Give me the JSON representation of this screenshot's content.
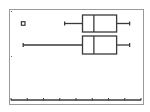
{
  "colors": {
    "background": "#ffffff",
    "frame": "#9a9a9a",
    "ink": "#3a3a3a"
  },
  "chart_data": {
    "type": "boxplot",
    "title": "",
    "xlabel": "",
    "ylabel": "",
    "xlim": [
      0,
      8
    ],
    "tick_count": 9,
    "grid": false,
    "series": [
      {
        "name": "Plot1 (modified boxplot)",
        "outliers": [
          0.75
        ],
        "whisker_low": 3.3,
        "q1": 4.4,
        "median": 5.1,
        "q3": 6.5,
        "whisker_high": 7.3
      },
      {
        "name": "Plot2 (boxplot)",
        "outliers": [],
        "whisker_low": 0.75,
        "q1": 4.4,
        "median": 5.1,
        "q3": 6.5,
        "whisker_high": 7.3
      }
    ]
  }
}
